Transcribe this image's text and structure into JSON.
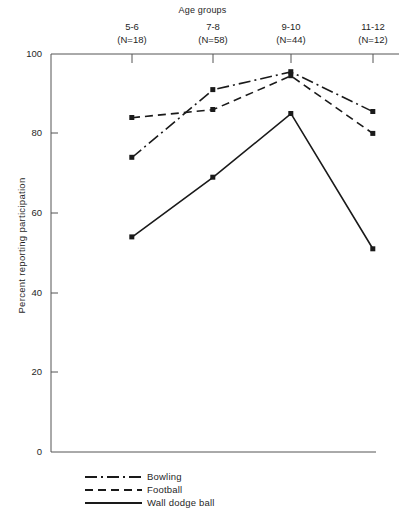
{
  "chart_data": {
    "type": "line",
    "title": "Age groups",
    "xlabel": "Age groups",
    "ylabel": "Percent reporting participation",
    "categories": [
      "5-6",
      "7-8",
      "9-10",
      "11-12"
    ],
    "category_sublabels": [
      "(N=18)",
      "(N=58)",
      "(N=44)",
      "(N=12)"
    ],
    "ylim": [
      0,
      100
    ],
    "yticks": [
      0,
      20,
      40,
      60,
      80,
      100
    ],
    "ytick_labels": [
      "0",
      "20",
      "40",
      "60",
      "80",
      "100"
    ],
    "grid": false,
    "legend_position": "bottom-left-below-axes",
    "series": [
      {
        "name": "Bowling",
        "style": "dash-dot",
        "color": "#1a1a1a",
        "marker": "square",
        "values": [
          74,
          91,
          95.5,
          85.5
        ]
      },
      {
        "name": "Football",
        "style": "dashed",
        "color": "#1a1a1a",
        "marker": "square",
        "values": [
          84,
          86,
          94.5,
          80
        ]
      },
      {
        "name": "Wall dodge ball",
        "style": "solid",
        "color": "#1a1a1a",
        "marker": "square",
        "values": [
          54,
          69,
          85,
          51
        ]
      }
    ]
  },
  "axis": {
    "top_label": "Age groups",
    "y_axis_label": "Percent reporting participation"
  },
  "columns": [
    {
      "label": "5-6",
      "n": "(N=18)"
    },
    {
      "label": "7-8",
      "n": "(N=58)"
    },
    {
      "label": "9-10",
      "n": "(N=44)"
    },
    {
      "label": "11-12",
      "n": "(N=12)"
    }
  ],
  "yticks": [
    {
      "value": "100"
    },
    {
      "value": "80"
    },
    {
      "value": "60"
    },
    {
      "value": "40"
    },
    {
      "value": "20"
    },
    {
      "value": "0"
    }
  ],
  "legend": [
    {
      "label": "Bowling"
    },
    {
      "label": "Football"
    },
    {
      "label": "Wall dodge ball"
    }
  ],
  "colors": {
    "ink": "#1a1a1a",
    "axis": "#555555",
    "background": "#ffffff"
  }
}
